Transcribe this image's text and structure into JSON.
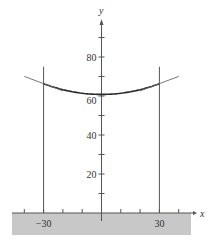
{
  "chart_data": {
    "type": "line",
    "title": "",
    "xlabel": "x",
    "ylabel": "y",
    "xlim": [
      -48,
      42
    ],
    "ylim": [
      -12,
      104
    ],
    "x_ticks": [
      -40,
      -30,
      -20,
      -10,
      10,
      20,
      30,
      40
    ],
    "x_tick_labels": {
      "-30": "−30",
      "30": "30"
    },
    "y_ticks": [
      10,
      20,
      30,
      40,
      50,
      60,
      70,
      80,
      90
    ],
    "y_tick_labels": {
      "20": "20",
      "40": "40",
      "60": "60",
      "80": "80"
    },
    "series": [
      {
        "name": "cable",
        "x": [
          -30,
          -20,
          -10,
          0,
          10,
          20,
          30
        ],
        "y": [
          66.3,
          63.2,
          61.4,
          60.8,
          61.4,
          63.2,
          66.3
        ]
      }
    ],
    "annotations": [
      {
        "type": "vertical-line",
        "x": -30,
        "y_range": [
          0,
          75
        ],
        "label": "left pole"
      },
      {
        "type": "vertical-line",
        "x": 30,
        "y_range": [
          0,
          75
        ],
        "label": "right pole"
      },
      {
        "type": "tangent-line",
        "at_x": -30
      },
      {
        "type": "tangent-line",
        "at_x": 30
      },
      {
        "type": "shaded-ground",
        "y_below": 0
      }
    ],
    "grid": false,
    "colors": {
      "curve": "#2a2a2a",
      "axes": "#555555",
      "ground": "#c8c8c8"
    }
  }
}
